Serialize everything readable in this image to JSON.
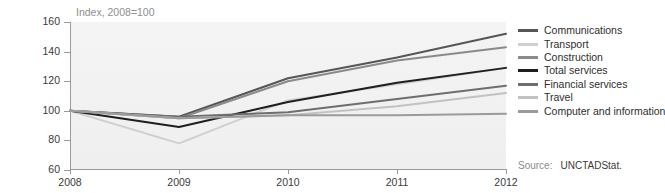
{
  "chart_data": {
    "type": "line",
    "title": "Index, 2008=100",
    "xlabel": "",
    "ylabel": "",
    "x": [
      2008,
      2009,
      2010,
      2011,
      2012
    ],
    "xlim": [
      2008,
      2012
    ],
    "ylim": [
      60,
      160
    ],
    "yticks": [
      60,
      80,
      100,
      120,
      140,
      160
    ],
    "xticks": [
      "2008",
      "2009",
      "2010",
      "2011",
      "2012"
    ],
    "grid": false,
    "legend_position": "right",
    "series": [
      {
        "name": "Communications",
        "values": [
          100,
          96,
          122,
          136,
          152
        ],
        "color": "#565656"
      },
      {
        "name": "Transport",
        "values": [
          100,
          78,
          107,
          118,
          129
        ],
        "color": "#cfcfcf"
      },
      {
        "name": "Construction",
        "values": [
          100,
          95,
          120,
          134,
          143
        ],
        "color": "#8a8a8a"
      },
      {
        "name": "Total services",
        "values": [
          100,
          89,
          106,
          119,
          129
        ],
        "color": "#1f1f1f"
      },
      {
        "name": "Financial services",
        "values": [
          100,
          96,
          99,
          108,
          117
        ],
        "color": "#6e6e6e"
      },
      {
        "name": "Travel",
        "values": [
          100,
          95,
          97,
          103,
          112
        ],
        "color": "#c2c2c2"
      },
      {
        "name": "Computer and information",
        "values": [
          100,
          95,
          97,
          97,
          98
        ],
        "color": "#9b9b9b"
      }
    ]
  },
  "source": {
    "label": "Source:",
    "value": "UNCTADStat."
  }
}
